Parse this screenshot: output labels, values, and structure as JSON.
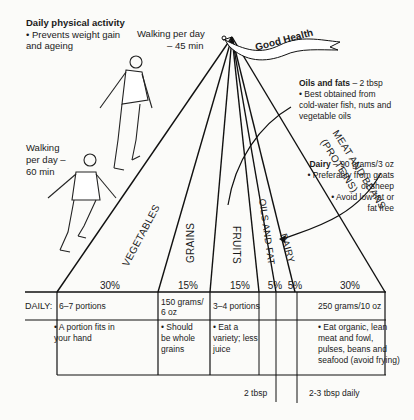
{
  "activity": {
    "title": "Daily physical activity",
    "bullet": "• Prevents weight gain and ageing",
    "walk_45_line1": "Walking per day",
    "walk_45_line2": "– 45 min",
    "walk_60_line1": "Walking",
    "walk_60_line2": "per day –",
    "walk_60_line3": "60 min"
  },
  "flag": {
    "label": "Good Health"
  },
  "oils_note": {
    "title": "Oils and fats",
    "amount": " – 2 tbsp",
    "line1": "• Best obtained from",
    "line2": "cold-water fish, nuts and",
    "line3": "vegetable oils"
  },
  "dairy_note": {
    "title": "Dairy",
    "amount": " – 90 grams/3 oz",
    "line1": "• Preferably from goats",
    "line2": "or sheep",
    "line3": "• Avoid low fat or",
    "line4": "fat free"
  },
  "pyramid": {
    "segments": [
      {
        "label": "VEGETABLES",
        "percent": "30%"
      },
      {
        "label": "GRAINS",
        "percent": "15%"
      },
      {
        "label": "FRUITS",
        "percent": "15%"
      },
      {
        "label": "OILS AND FAT",
        "percent": "5%"
      },
      {
        "label": "DAIRY",
        "percent": "5%"
      },
      {
        "label": "MEAT AND BEANS",
        "label2": "(PROTEINS)",
        "percent": "30%"
      }
    ]
  },
  "table": {
    "daily_label": "DAILY:",
    "amounts": {
      "vegetables": "6–7 portions",
      "grains_1": "150 grams/",
      "grains_2": "6 oz",
      "fruits": "3–4 portions",
      "meat": "250 grams/10 oz"
    },
    "notes": {
      "vegetables_1": "• A portion fits in",
      "vegetables_2": "your hand",
      "grains_1": "• Should",
      "grains_2": "be whole",
      "grains_3": "grains",
      "fruits_1": "• Eat a",
      "fruits_2": "variety; less",
      "fruits_3": "juice",
      "meat_1": "• Eat organic, lean",
      "meat_2": "meat and fowl,",
      "meat_3": "pulses, beans and",
      "meat_4": "seafood (avoid frying)"
    },
    "footer": {
      "oils": "2 tbsp",
      "dairy": "2-3 tbsp daily"
    }
  }
}
